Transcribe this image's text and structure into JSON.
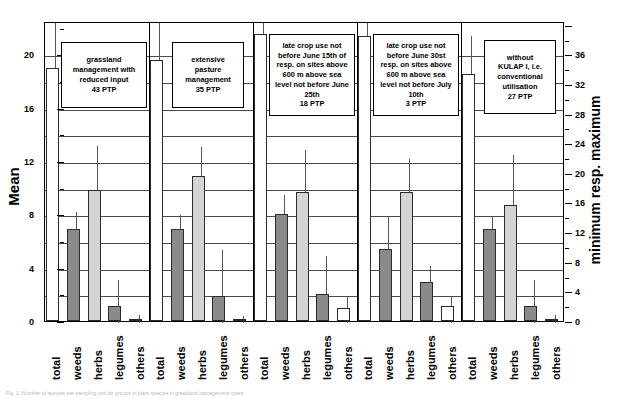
{
  "figure": {
    "caption": "Fig. 1: Number of species per sampling unit for groups of plant species in grassland management types"
  },
  "axes": {
    "left": {
      "title": "Mean",
      "min": 0,
      "max": 20,
      "display_max": 22.5,
      "tick_step": 4,
      "minor_step": 2,
      "ticks": [
        0,
        4,
        8,
        12,
        16,
        20
      ]
    },
    "right": {
      "title": "minimum resp. maximum",
      "min": 0,
      "max": 36,
      "display_max": 40.5,
      "tick_step": 4,
      "minor_step": 2,
      "ticks": [
        0,
        4,
        8,
        12,
        16,
        20,
        24,
        28,
        32,
        36
      ]
    }
  },
  "categories": [
    "total",
    "weeds",
    "herbs",
    "legumes",
    "others"
  ],
  "colors": {
    "total": "#ffffff",
    "weeds": "#8a8a8a",
    "herbs": "#d4d4d4",
    "legumes": "#8a8a8a",
    "others": "#ffffff",
    "outline": "#2b2b2b",
    "grid": "#4a4a4a"
  },
  "annotations": [
    {
      "id": "ann-1",
      "text": "grassland\nmanagement with\nreduced input\n43 PTP"
    },
    {
      "id": "ann-2",
      "text": "extensive\npasture\nmanagement\n35 PTP"
    },
    {
      "id": "ann-3",
      "text": "late crop use not\nbefore June 15th of\nresp. on sites above\n600 m above sea\nlevel not before June\n25th\n18 PTP"
    },
    {
      "id": "ann-4",
      "text": "late crop use not\nbefore  June 30st\nresp. on sites above\n600 m above sea\nlevel not before July\n10th\n3 PTP"
    },
    {
      "id": "ann-5",
      "text": "without\nKULAP I, i.e.\nconventional\nutilisation\n27 PTP"
    }
  ],
  "chart_data": {
    "type": "bar",
    "title": "",
    "xlabel": "",
    "ylabel": "Mean",
    "ylabel_secondary": "minimum resp. maximum",
    "ylim": [
      0,
      20
    ],
    "ylim_secondary": [
      0,
      36
    ],
    "grid": true,
    "legend": "none",
    "categories": [
      "total",
      "weeds",
      "herbs",
      "legumes",
      "others"
    ],
    "groups": [
      {
        "name": "grassland management with reduced input",
        "ptp": 43,
        "values": [
          19.0,
          6.9,
          9.8,
          1.1,
          0.12
        ],
        "minimum": [
          16.0,
          4.0,
          3.5,
          0.0,
          0.0
        ],
        "maximum": [
          22.5,
          8.3,
          13.3,
          3.2,
          0.6
        ]
      },
      {
        "name": "extensive pasture management",
        "ptp": 35,
        "values": [
          19.6,
          6.9,
          10.9,
          1.9,
          0.12
        ],
        "minimum": [
          16.2,
          4.5,
          4.0,
          0.0,
          0.0
        ],
        "maximum": [
          22.6,
          8.1,
          13.2,
          5.5,
          0.55
        ]
      },
      {
        "name": "late crop use not before June 15th of resp. on sites above 600 m above sea level not before June 25th",
        "ptp": 18,
        "values": [
          21.5,
          8.0,
          9.7,
          2.0,
          1.0
        ],
        "minimum": [
          18.0,
          5.0,
          4.0,
          0.5,
          0.0
        ],
        "maximum": [
          23.0,
          9.6,
          13.0,
          5.0,
          2.0
        ]
      },
      {
        "name": "late crop use not before June 30st resp. on sites above 600 m above sea level not before July 10th",
        "ptp": 3,
        "values": [
          21.4,
          5.4,
          9.7,
          2.9,
          1.1
        ],
        "minimum": [
          18.5,
          2.0,
          4.8,
          1.5,
          0.0
        ],
        "maximum": [
          23.0,
          8.0,
          12.3,
          4.3,
          2.0
        ]
      },
      {
        "name": "without KULAP I, i.e. conventional utilisation",
        "ptp": 27,
        "values": [
          18.5,
          6.9,
          8.7,
          1.1,
          0.12
        ],
        "minimum": [
          15.0,
          4.2,
          3.0,
          0.0,
          0.0
        ],
        "maximum": [
          21.5,
          8.0,
          12.6,
          3.2,
          0.6
        ]
      }
    ]
  }
}
